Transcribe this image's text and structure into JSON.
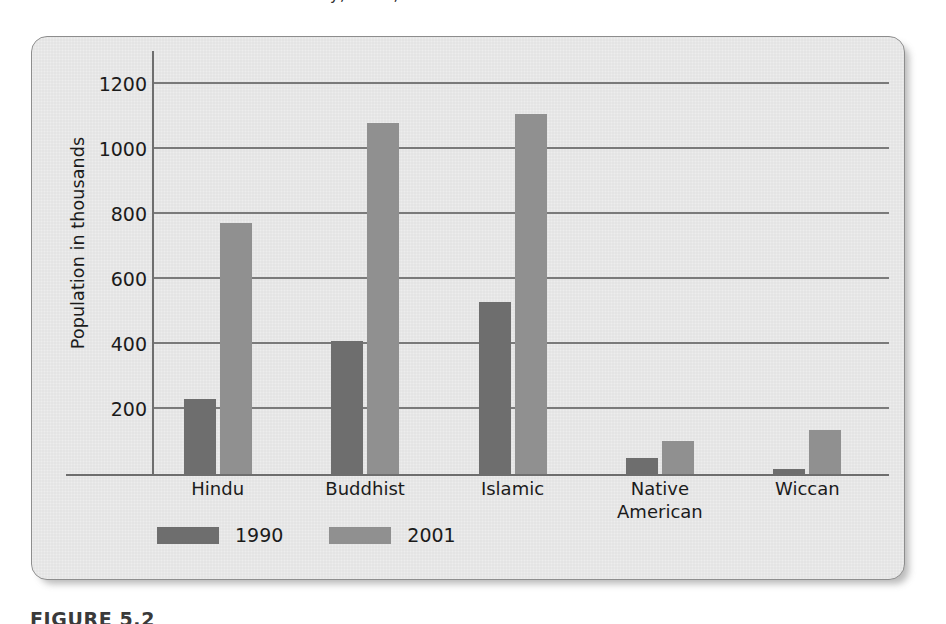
{
  "page": {
    "top_fragment": "y, 1990,",
    "caption": "FIGURE 5.2"
  },
  "chart_data": {
    "type": "bar",
    "title": "",
    "xlabel": "",
    "ylabel": "Population in thousands",
    "categories": [
      "Hindu",
      "Buddhist",
      "Islamic",
      "Native American",
      "Wiccan"
    ],
    "series": [
      {
        "name": "1990",
        "color": "#6e6e6e",
        "values": [
          230,
          408,
          530,
          50,
          15
        ]
      },
      {
        "name": "2001",
        "color": "#909090",
        "values": [
          770,
          1080,
          1105,
          103,
          134
        ]
      }
    ],
    "ylim": [
      0,
      1300
    ],
    "yticks": [
      200,
      400,
      600,
      800,
      1000,
      1200
    ],
    "ytick_labels": [
      "200",
      "400",
      "600",
      "800",
      "1000",
      "1200"
    ],
    "grid": true,
    "legend_position": "bottom-left"
  },
  "xlabels": [
    {
      "line1": "Hindu",
      "line2": ""
    },
    {
      "line1": "Buddhist",
      "line2": ""
    },
    {
      "line1": "Islamic",
      "line2": ""
    },
    {
      "line1": "Native",
      "line2": "American"
    },
    {
      "line1": "Wiccan",
      "line2": ""
    }
  ]
}
